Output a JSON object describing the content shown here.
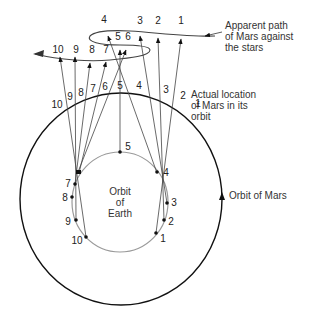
{
  "labels": {
    "apparent_path": "Apparent path\nof Mars against\nthe stars",
    "actual_location": "Actual location\nof Mars in its\norbit",
    "orbit_of_mars": "Orbit of Mars",
    "orbit_of_earth": "Orbit\nof\nEarth"
  },
  "colors": {
    "mars_orbit": "#111111",
    "earth_orbit": "#999999",
    "sight_lines": "#333333",
    "text": "#333333"
  },
  "sky_positions": [
    {
      "n": "1",
      "x": 181,
      "y": 21
    },
    {
      "n": "2",
      "x": 158,
      "y": 21
    },
    {
      "n": "3",
      "x": 140,
      "y": 21
    },
    {
      "n": "4",
      "x": 104,
      "y": 20
    },
    {
      "n": "5",
      "x": 118,
      "y": 37
    },
    {
      "n": "6",
      "x": 128,
      "y": 37
    },
    {
      "n": "7",
      "x": 106,
      "y": 50
    },
    {
      "n": "8",
      "x": 92,
      "y": 50
    },
    {
      "n": "9",
      "x": 76,
      "y": 50
    },
    {
      "n": "10",
      "x": 58,
      "y": 50
    }
  ],
  "mars_positions": [
    {
      "n": "1",
      "x": 198,
      "y": 104
    },
    {
      "n": "2",
      "x": 183,
      "y": 96
    },
    {
      "n": "3",
      "x": 166,
      "y": 90
    },
    {
      "n": "4",
      "x": 139,
      "y": 86
    },
    {
      "n": "5",
      "x": 120,
      "y": 86
    },
    {
      "n": "6",
      "x": 105,
      "y": 87
    },
    {
      "n": "7",
      "x": 93,
      "y": 89
    },
    {
      "n": "8",
      "x": 81,
      "y": 93
    },
    {
      "n": "9",
      "x": 70,
      "y": 97
    },
    {
      "n": "10",
      "x": 57,
      "y": 105
    }
  ],
  "earth_positions": [
    {
      "n": "1",
      "x": 163,
      "y": 239
    },
    {
      "n": "2",
      "x": 171,
      "y": 222
    },
    {
      "n": "3",
      "x": 174,
      "y": 203
    },
    {
      "n": "4",
      "x": 166,
      "y": 173
    },
    {
      "n": "5",
      "x": 128,
      "y": 147
    },
    {
      "n": "7",
      "x": 68,
      "y": 184
    },
    {
      "n": "8",
      "x": 65,
      "y": 198
    },
    {
      "n": "9",
      "x": 68,
      "y": 222
    },
    {
      "n": "10",
      "x": 77,
      "y": 241
    }
  ]
}
